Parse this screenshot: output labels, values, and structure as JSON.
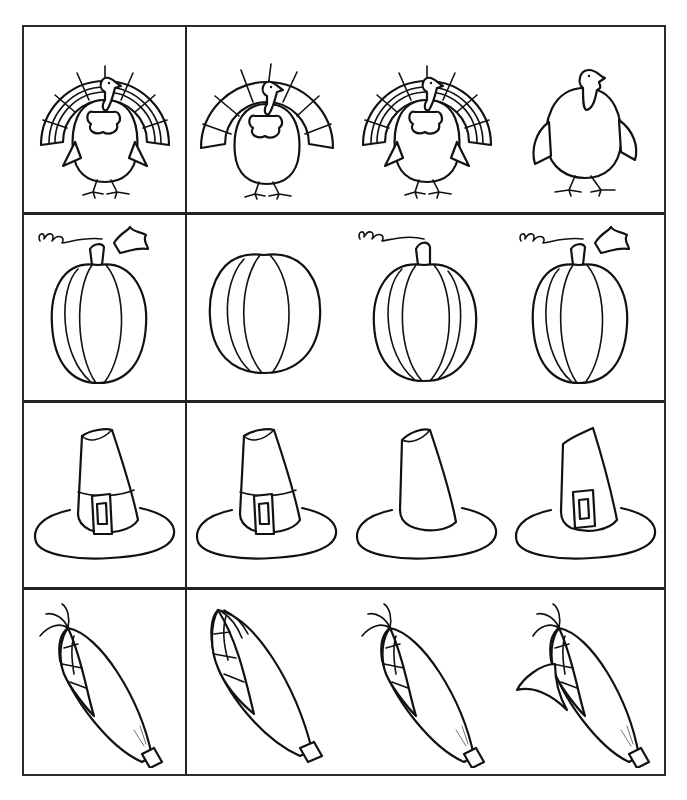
{
  "worksheet": {
    "type": "which-one-matches",
    "theme": "Thanksgiving",
    "layout": {
      "rows": 4,
      "reference_column": 1,
      "choice_columns": 3
    },
    "colors": {
      "line": "#111111",
      "background": "#ffffff",
      "grid": "#222222"
    },
    "rows": [
      {
        "subject": "turkey",
        "reference": {
          "variant": "fan-double-band"
        },
        "choices": [
          {
            "variant": "fan-single-band"
          },
          {
            "variant": "fan-double-band"
          },
          {
            "variant": "no-fan"
          }
        ]
      },
      {
        "subject": "pumpkin",
        "reference": {
          "variant": "stem-leaf-vine"
        },
        "choices": [
          {
            "variant": "no-stem"
          },
          {
            "variant": "stem-vine"
          },
          {
            "variant": "stem-leaf-vine"
          }
        ]
      },
      {
        "subject": "pilgrim-hat",
        "reference": {
          "variant": "band-buckle"
        },
        "choices": [
          {
            "variant": "band-buckle"
          },
          {
            "variant": "plain"
          },
          {
            "variant": "buckle-no-band"
          }
        ]
      },
      {
        "subject": "corn",
        "reference": {
          "variant": "silk-tassel"
        },
        "choices": [
          {
            "variant": "no-silk"
          },
          {
            "variant": "silk-tassel"
          },
          {
            "variant": "silk-leaf"
          }
        ]
      }
    ]
  }
}
